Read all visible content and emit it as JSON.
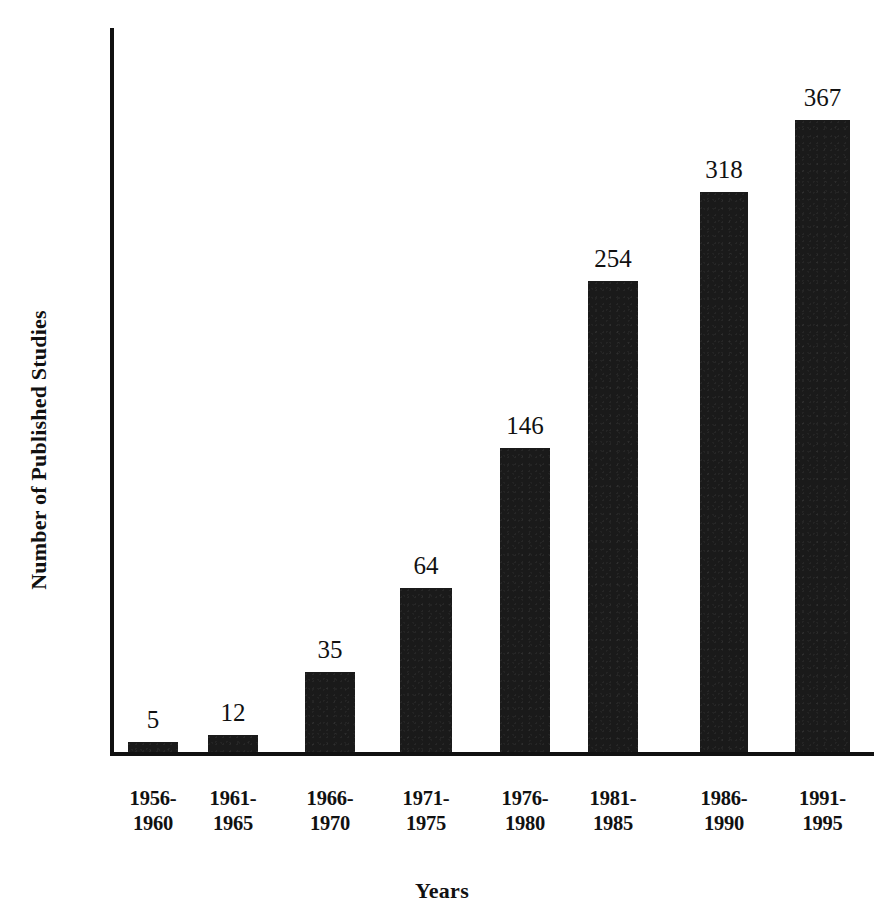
{
  "chart_data": {
    "type": "bar",
    "title": "",
    "xlabel": "Years",
    "ylabel": "Number of Published Studies",
    "categories": [
      "1956-1960",
      "1961-1965",
      "1966-1970",
      "1971-1975",
      "1976-1980",
      "1981-1985",
      "1986-1990",
      "1991-1995"
    ],
    "category_lines": [
      {
        "line1": "1956-",
        "line2": "1960"
      },
      {
        "line1": "1961-",
        "line2": "1965"
      },
      {
        "line1": "1966-",
        "line2": "1970"
      },
      {
        "line1": "1971-",
        "line2": "1975"
      },
      {
        "line1": "1976-",
        "line2": "1980"
      },
      {
        "line1": "1981-",
        "line2": "1985"
      },
      {
        "line1": "1986-",
        "line2": "1990"
      },
      {
        "line1": "1991-",
        "line2": "1995"
      }
    ],
    "values": [
      5,
      12,
      35,
      64,
      146,
      254,
      318,
      367
    ],
    "value_labels": [
      "5",
      "12",
      "35",
      "64",
      "146",
      "254",
      "318",
      "367"
    ],
    "bar_pixel_heights": [
      10,
      17,
      80,
      164,
      304,
      471,
      560,
      632
    ],
    "bar_left_positions": [
      128,
      208,
      305,
      400,
      500,
      588,
      700,
      795
    ],
    "bar_widths": [
      50,
      50,
      50,
      52,
      50,
      50,
      48,
      55
    ],
    "ylim": [
      0,
      400
    ],
    "grid": false,
    "legend": null,
    "bar_color": "#1a1a1a",
    "axis_color": "#111111",
    "background_color": "#ffffff"
  }
}
